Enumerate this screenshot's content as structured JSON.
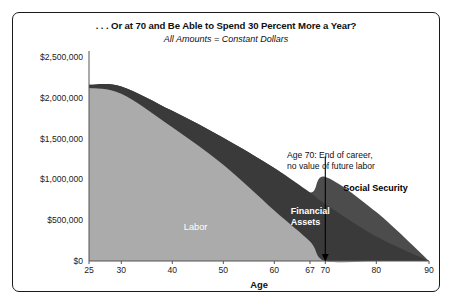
{
  "chart_data": {
    "type": "area",
    "title": ". . . Or at 70 and Be Able to Spend 30 Percent More a Year?",
    "subtitle": "All Amounts = Constant Dollars",
    "xlabel": "Age",
    "ylabel": "",
    "stacked": true,
    "grid": false,
    "legend_position": "inline-labels",
    "xlim": [
      25,
      90
    ],
    "ylim": [
      0,
      2500000
    ],
    "x_ticks": [
      25,
      30,
      40,
      50,
      60,
      67,
      70,
      80,
      90
    ],
    "x_tick_labels": [
      "25",
      "30",
      "40",
      "50",
      "60",
      "67",
      "70",
      "80",
      "90"
    ],
    "y_ticks": [
      0,
      500000,
      1000000,
      1500000,
      2000000,
      2500000
    ],
    "y_tick_labels": [
      "$0",
      "$500,000",
      "$1,000,000",
      "$1,500,000",
      "$2,000,000",
      "$2,500,000"
    ],
    "x": [
      25,
      30,
      40,
      50,
      60,
      67,
      70,
      80,
      90
    ],
    "series": [
      {
        "name": "Labor",
        "color": "#ababab",
        "values": [
          2120000,
          2050000,
          1640000,
          1180000,
          620000,
          240000,
          0,
          0,
          0
        ]
      },
      {
        "name": "Financial Assets",
        "color": "#3a3a3a",
        "values": [
          40000,
          90000,
          200000,
          330000,
          520000,
          600000,
          700000,
          300000,
          0
        ]
      },
      {
        "name": "Social Security",
        "color": "#4c4c4c",
        "values": [
          0,
          0,
          0,
          0,
          0,
          0,
          330000,
          300000,
          0
        ]
      }
    ],
    "annotations": [
      {
        "name": "age-70-callout",
        "text_lines": [
          "Age 70: End of career,",
          "no value of future labor"
        ],
        "points_to_x": 70,
        "points_to_y": 0
      }
    ],
    "band_labels": [
      {
        "name": "Labor",
        "at_x": 45,
        "color": "#ffffff"
      },
      {
        "name": "Financial Assets",
        "at_x": 66,
        "color": "#ffffff"
      },
      {
        "name": "Social Security",
        "at_x": 79,
        "color": "#000000"
      }
    ]
  }
}
